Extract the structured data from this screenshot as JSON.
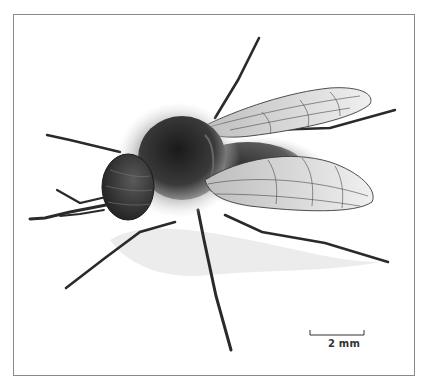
{
  "figure": {
    "scale_bar": {
      "label": "2 mm"
    },
    "colors": {
      "frame": "#8a8a8a",
      "ink": "#2a2a2a",
      "wing": "#d9d9d9",
      "shadow": "#ececec"
    }
  }
}
